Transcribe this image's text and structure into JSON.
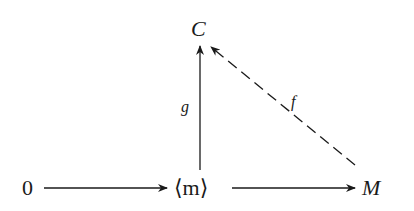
{
  "diagram": {
    "type": "commutative-diagram",
    "nodes": {
      "zero": "0",
      "m_generated": "⟨m⟩",
      "M": "M",
      "C": "C"
    },
    "arrows": [
      {
        "from": "0",
        "to": "⟨m⟩",
        "style": "solid",
        "label": ""
      },
      {
        "from": "⟨m⟩",
        "to": "M",
        "style": "solid",
        "label": ""
      },
      {
        "from": "⟨m⟩",
        "to": "C",
        "style": "solid",
        "label": "g"
      },
      {
        "from": "M",
        "to": "C",
        "style": "dashed",
        "label": "f"
      }
    ],
    "labels": {
      "g": "g",
      "f": "f"
    }
  }
}
